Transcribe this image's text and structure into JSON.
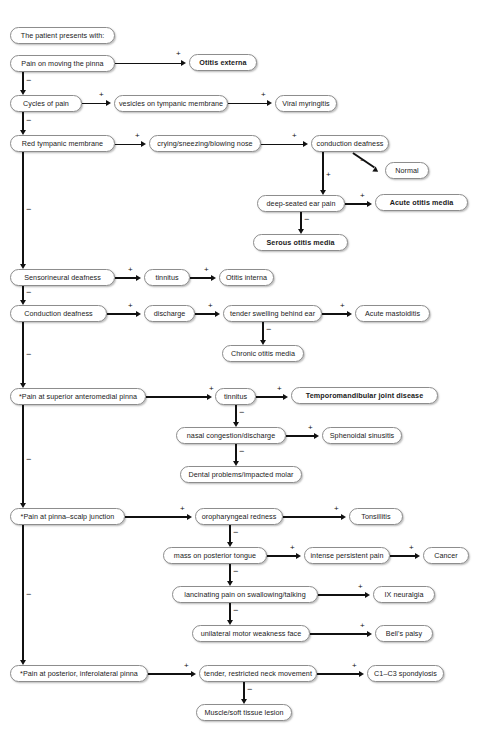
{
  "diagram": {
    "type": "flowchart",
    "root_label": "The patient presents with:",
    "signs": {
      "positive": "+",
      "negative": "−"
    },
    "colors": {
      "box_border": "#8d8d8d",
      "line": "#111111",
      "background": "#ffffff",
      "text": "#1a1a1a"
    },
    "nodes": {
      "intro": "The patient presents with:",
      "pain_moving_pinna": "Pain on moving the pinna",
      "otitis_externa": "Otitis externa",
      "cycles_of_pain": "Cycles of pain",
      "vesicles_tympanic": "vesicles on tympanic membrane",
      "viral_myringitis": "Viral myringitis",
      "red_tympanic": "Red tympanic membrane",
      "crying_sneezing": "crying/sneezing/blowing nose",
      "conduction_deafness_top": "conduction deafness",
      "normal": "Normal",
      "deep_seated_ear_pain": "deep-seated ear pain",
      "acute_otitis_media": "Acute otitis media",
      "serous_otitis_media": "Serous otitis media",
      "sensorineural_deafness": "Sensorineural deafness",
      "tinnitus_1": "tinnitus",
      "otitis_interna": "Otitis interna",
      "conduction_deafness": "Conduction deafness",
      "discharge": "discharge",
      "tender_swelling": "tender swelling behind ear",
      "acute_mastoiditis": "Acute mastoiditis",
      "chronic_otitis_media": "Chronic otitis media",
      "pain_superior_anteromedial": "*Pain at superior anteromedial pinna",
      "tinnitus_2": "tinnitus",
      "tmj_disease": "Temporomandibular joint disease",
      "nasal_congestion": "nasal congestion/discharge",
      "sphenoidal_sinusitis": "Sphenoidal sinusitis",
      "dental_problems": "Dental problems/impacted molar",
      "pain_pinna_scalp": "*Pain at pinna–scalp junction",
      "oropharyngeal_redness": "oropharyngeal redness",
      "tonsillitis": "Tonsillitis",
      "mass_posterior_tongue": "mass on posterior tongue",
      "intense_persistent_pain": "intense persistent pain",
      "cancer": "Cancer",
      "lancinating_pain": "lancinating pain on swallowing/talking",
      "ix_neuralgia": "IX neuralgia",
      "unilateral_motor_weakness": "unilateral motor weakness face",
      "bells_palsy": "Bell's palsy",
      "pain_posterior_inferolateral": "*Pain at posterior, inferolateral pinna",
      "tender_restricted_neck": "tender, restricted neck movement",
      "c1_c3_spondylosis": "C1–C3 spondylosis",
      "muscle_soft_tissue": "Muscle/soft tissue lesion"
    },
    "bold_nodes": [
      "otitis_externa",
      "acute_otitis_media",
      "serous_otitis_media",
      "tmj_disease"
    ],
    "edges": [
      {
        "from": "pain_moving_pinna",
        "to": "otitis_externa",
        "sign": "+"
      },
      {
        "from": "pain_moving_pinna",
        "to": "cycles_of_pain",
        "sign": "−"
      },
      {
        "from": "cycles_of_pain",
        "to": "vesicles_tympanic",
        "sign": "+"
      },
      {
        "from": "vesicles_tympanic",
        "to": "viral_myringitis",
        "sign": "+"
      },
      {
        "from": "cycles_of_pain",
        "to": "red_tympanic",
        "sign": "−"
      },
      {
        "from": "red_tympanic",
        "to": "crying_sneezing",
        "sign": "+"
      },
      {
        "from": "crying_sneezing",
        "to": "conduction_deafness_top",
        "sign": "+"
      },
      {
        "from": "conduction_deafness_top",
        "to": "normal",
        "sign": "−"
      },
      {
        "from": "conduction_deafness_top",
        "to": "deep_seated_ear_pain",
        "sign": "+"
      },
      {
        "from": "deep_seated_ear_pain",
        "to": "acute_otitis_media",
        "sign": "+"
      },
      {
        "from": "deep_seated_ear_pain",
        "to": "serous_otitis_media",
        "sign": "−"
      },
      {
        "from": "red_tympanic",
        "to": "sensorineural_deafness",
        "sign": "−"
      },
      {
        "from": "sensorineural_deafness",
        "to": "tinnitus_1",
        "sign": "+"
      },
      {
        "from": "tinnitus_1",
        "to": "otitis_interna",
        "sign": "+"
      },
      {
        "from": "sensorineural_deafness",
        "to": "conduction_deafness",
        "sign": "−"
      },
      {
        "from": "conduction_deafness",
        "to": "discharge",
        "sign": "+"
      },
      {
        "from": "discharge",
        "to": "tender_swelling",
        "sign": "+"
      },
      {
        "from": "tender_swelling",
        "to": "acute_mastoiditis",
        "sign": "+"
      },
      {
        "from": "tender_swelling",
        "to": "chronic_otitis_media",
        "sign": "−"
      },
      {
        "from": "conduction_deafness",
        "to": "pain_superior_anteromedial",
        "sign": "−"
      },
      {
        "from": "pain_superior_anteromedial",
        "to": "tinnitus_2",
        "sign": "+"
      },
      {
        "from": "tinnitus_2",
        "to": "tmj_disease",
        "sign": "+"
      },
      {
        "from": "tinnitus_2",
        "to": "nasal_congestion",
        "sign": "−"
      },
      {
        "from": "nasal_congestion",
        "to": "sphenoidal_sinusitis",
        "sign": "+"
      },
      {
        "from": "nasal_congestion",
        "to": "dental_problems",
        "sign": "−"
      },
      {
        "from": "pain_superior_anteromedial",
        "to": "pain_pinna_scalp",
        "sign": "−"
      },
      {
        "from": "pain_pinna_scalp",
        "to": "oropharyngeal_redness",
        "sign": "+"
      },
      {
        "from": "oropharyngeal_redness",
        "to": "tonsillitis",
        "sign": "+"
      },
      {
        "from": "oropharyngeal_redness",
        "to": "mass_posterior_tongue",
        "sign": "−"
      },
      {
        "from": "mass_posterior_tongue",
        "to": "intense_persistent_pain",
        "sign": "+"
      },
      {
        "from": "intense_persistent_pain",
        "to": "cancer",
        "sign": "+"
      },
      {
        "from": "mass_posterior_tongue",
        "to": "lancinating_pain",
        "sign": "−"
      },
      {
        "from": "lancinating_pain",
        "to": "ix_neuralgia",
        "sign": "+"
      },
      {
        "from": "lancinating_pain",
        "to": "unilateral_motor_weakness",
        "sign": "−"
      },
      {
        "from": "unilateral_motor_weakness",
        "to": "bells_palsy",
        "sign": "+"
      },
      {
        "from": "pain_pinna_scalp",
        "to": "pain_posterior_inferolateral",
        "sign": "−"
      },
      {
        "from": "pain_posterior_inferolateral",
        "to": "tender_restricted_neck",
        "sign": "+"
      },
      {
        "from": "tender_restricted_neck",
        "to": "c1_c3_spondylosis",
        "sign": "+"
      },
      {
        "from": "tender_restricted_neck",
        "to": "muscle_soft_tissue",
        "sign": "−"
      }
    ]
  }
}
